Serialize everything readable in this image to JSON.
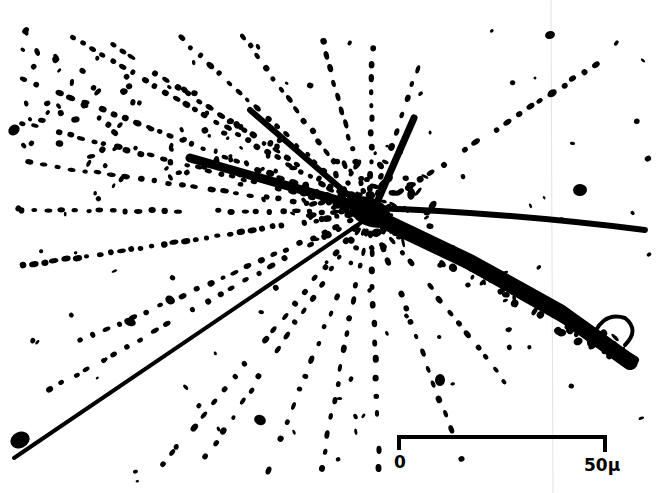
{
  "figure": {
    "ink_color": "#000000",
    "background_color": "#ffffff",
    "scan_artifact_color": "#d8d8d8"
  },
  "scale_bar": {
    "start_label": "0",
    "end_label": "50μ",
    "length_value": 50,
    "unit": "micron"
  },
  "tracks": {
    "description": "Dotted and dense tracks emanating from the star center",
    "dense_track_count": 4,
    "dotted_track_count": 22
  }
}
